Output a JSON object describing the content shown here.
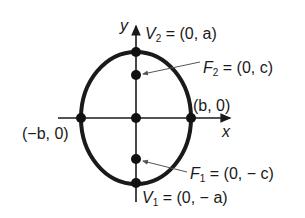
{
  "diagram": {
    "type": "ellipse-vertical-major-axis",
    "axes": {
      "x_label": "x",
      "y_label": "y"
    },
    "points": [
      {
        "id": "V2",
        "label": "V",
        "sub": "2",
        "coords": "= (0, a)"
      },
      {
        "id": "F2",
        "label": "F",
        "sub": "2",
        "coords": "= (0, c)"
      },
      {
        "id": "right",
        "label": "(b, 0)"
      },
      {
        "id": "left",
        "label": "(−b, 0)"
      },
      {
        "id": "F1",
        "label": "F",
        "sub": "1",
        "coords": "= (0, − c)"
      },
      {
        "id": "V1",
        "label": "V",
        "sub": "1",
        "coords": "= (0, − a)"
      }
    ],
    "colors": {
      "stroke": "#1a1a1a",
      "arrow": "#555555",
      "background": "#ffffff"
    }
  }
}
